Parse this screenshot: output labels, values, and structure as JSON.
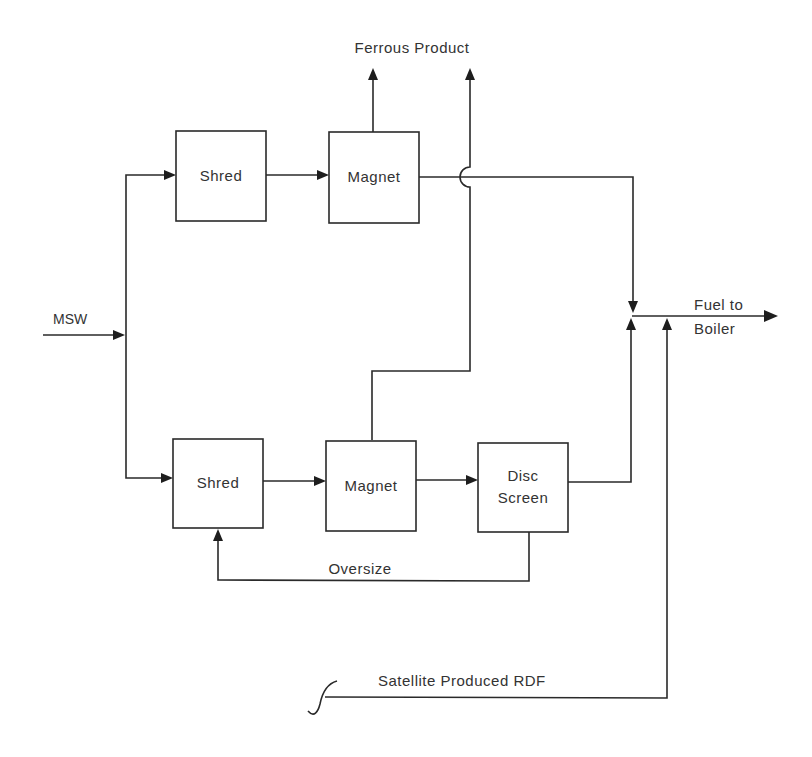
{
  "diagram": {
    "input": {
      "label": "MSW"
    },
    "top_line": {
      "shred": {
        "label": "Shred"
      },
      "magnet": {
        "label": "Magnet"
      }
    },
    "bottom_line": {
      "shred": {
        "label": "Shred"
      },
      "magnet": {
        "label": "Magnet"
      },
      "disc_screen": {
        "label_line1": "Disc",
        "label_line2": "Screen"
      },
      "oversize": {
        "label": "Oversize"
      }
    },
    "ferrous_output": {
      "label": "Ferrous  Product"
    },
    "fuel_output": {
      "label_line1": "Fuel  to",
      "label_line2": "Boiler"
    },
    "satellite_input": {
      "label": "Satellite  Produced  RDF"
    },
    "colors": {
      "line": "#2a2a2a",
      "text": "#333333",
      "background": "#ffffff"
    }
  }
}
